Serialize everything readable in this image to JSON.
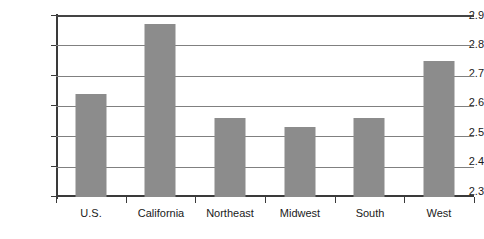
{
  "chart_data": {
    "type": "bar",
    "title": "",
    "xlabel": "",
    "ylabel": "",
    "categories": [
      "U.S.",
      "California",
      "Northeast",
      "Midwest",
      "South",
      "West"
    ],
    "values": [
      2.64,
      2.87,
      2.56,
      2.53,
      2.56,
      2.75
    ],
    "ylim": [
      2.3,
      2.9
    ],
    "ytick_labels": [
      "2.9",
      "2.8",
      "2.7",
      "2.6",
      "2.5",
      "2.4",
      "2.3"
    ],
    "ytick_values": [
      2.9,
      2.8,
      2.7,
      2.6,
      2.5,
      2.4,
      2.3
    ],
    "ytick_step": 0.1,
    "grid": true,
    "legend": "none",
    "series": [
      {
        "name": "Value",
        "values": [
          2.64,
          2.87,
          2.56,
          2.53,
          2.56,
          2.75
        ]
      }
    ],
    "colors": {
      "bar_fill": "#8c8c8c",
      "gridline": "#808080",
      "axis": "#3a3a3a",
      "text": "#1a1a1a",
      "background": "#ffffff"
    }
  }
}
